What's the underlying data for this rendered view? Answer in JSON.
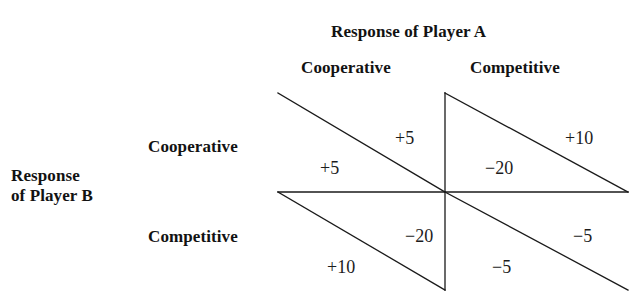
{
  "figure": {
    "title_top": "Response of Player A",
    "side_label_line1": "Response",
    "side_label_line2": "of Player B",
    "column_headers": [
      "Cooperative",
      "Competitive"
    ],
    "row_headers": [
      "Cooperative",
      "Competitive"
    ]
  },
  "chart_data": {
    "type": "table",
    "title": "Response of Player A",
    "xlabel": "Response of Player A",
    "ylabel": "Response of Player B",
    "grid": false,
    "legend": "none",
    "columns": [
      "Cooperative",
      "Competitive"
    ],
    "rows": [
      "Cooperative",
      "Competitive"
    ],
    "cells": [
      {
        "row": "Cooperative",
        "column": "Cooperative",
        "upper_right_value": "+5",
        "lower_left_value": "+5",
        "upper_right_player": "A",
        "lower_left_player": "B"
      },
      {
        "row": "Cooperative",
        "column": "Competitive",
        "upper_right_value": "+10",
        "lower_left_value": "−20",
        "upper_right_player": "A",
        "lower_left_player": "B"
      },
      {
        "row": "Competitive",
        "column": "Cooperative",
        "upper_right_value": "−20",
        "lower_left_value": "+10",
        "upper_right_player": "A",
        "lower_left_player": "B"
      },
      {
        "row": "Competitive",
        "column": "Competitive",
        "upper_right_value": "−5",
        "lower_left_value": "−5",
        "upper_right_player": "A",
        "lower_left_player": "B"
      }
    ],
    "payoff_labels": [
      {
        "id": "q1-upper",
        "text": "+5",
        "x": 395,
        "y": 128
      },
      {
        "id": "q1-lower",
        "text": "+5",
        "x": 320,
        "y": 158
      },
      {
        "id": "q2-upper",
        "text": "+10",
        "x": 565,
        "y": 128
      },
      {
        "id": "q2-lower",
        "text": "−20",
        "x": 485,
        "y": 158
      },
      {
        "id": "q3-upper",
        "text": "−20",
        "x": 405,
        "y": 226
      },
      {
        "id": "q3-lower",
        "text": "+10",
        "x": 327,
        "y": 257
      },
      {
        "id": "q4-upper",
        "text": "−5",
        "x": 573,
        "y": 226
      },
      {
        "id": "q4-lower",
        "text": "−5",
        "x": 492,
        "y": 257
      }
    ]
  },
  "style": {
    "line_color": "#1a1a1a",
    "text_color": "#121212",
    "background": "#ffffff"
  }
}
